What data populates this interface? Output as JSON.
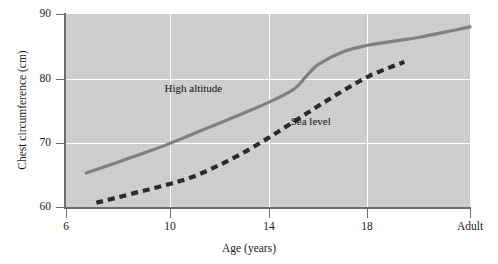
{
  "chart_data": {
    "type": "line",
    "title": "",
    "xlabel": "Age (years)",
    "ylabel": "Chest circumference (cm)",
    "xlim": [
      6,
      22
    ],
    "ylim": [
      60,
      90
    ],
    "xticks": [
      "6",
      "10",
      "14",
      "18",
      "Adult"
    ],
    "xtick_values": [
      6,
      10,
      14,
      18,
      22
    ],
    "yticks": [
      "60",
      "70",
      "80",
      "90"
    ],
    "ytick_values": [
      60,
      70,
      80,
      90
    ],
    "grid": "white gridlines at x = 10, 14, 18 and y = 70, 80",
    "legend_position": "inline annotations on plot",
    "plot_background": "#cfcfcf",
    "series": [
      {
        "name": "High altitude",
        "style": "solid",
        "color": "#808080",
        "label_position": {
          "x": 9.9,
          "y": 78.5
        },
        "x": [
          6.8,
          8,
          9,
          10,
          11,
          12,
          13,
          14,
          15,
          15.5,
          16,
          17,
          18,
          19,
          20,
          21,
          22
        ],
        "y": [
          65.4,
          67.0,
          68.4,
          69.8,
          71.4,
          73.0,
          74.6,
          76.3,
          78.3,
          80.3,
          82.2,
          84.2,
          85.2,
          85.8,
          86.4,
          87.2,
          88.0
        ]
      },
      {
        "name": "Sea level",
        "style": "dashed",
        "color": "#2b2b2b",
        "label_position": {
          "x": 14.9,
          "y": 73.5
        },
        "x": [
          7.2,
          8,
          9,
          10,
          11,
          12,
          13,
          14,
          15,
          16,
          17,
          18,
          19,
          19.4
        ],
        "y": [
          60.8,
          61.6,
          62.6,
          63.6,
          64.8,
          66.5,
          68.5,
          70.8,
          73.3,
          75.8,
          78.2,
          80.4,
          82.0,
          82.6
        ]
      }
    ]
  },
  "axes": {
    "y_title": "Chest circumference (cm)",
    "x_title": "Age (years)"
  },
  "annotations": {
    "high_altitude": "High altitude",
    "sea_level": "Sea level"
  }
}
